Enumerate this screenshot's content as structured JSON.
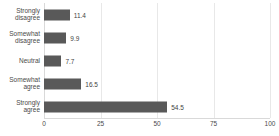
{
  "chart_data": {
    "type": "bar",
    "orientation": "horizontal",
    "title": "",
    "subtitle": "",
    "xlabel": "",
    "ylabel": "",
    "categories": [
      "Strongly disagree",
      "Somewhat disagree",
      "Neutral",
      "Somewhat agree",
      "Strongly agree"
    ],
    "values": [
      11.4,
      9.9,
      7.7,
      16.5,
      54.5
    ],
    "data_labels": [
      "11.4",
      "9.9",
      "7.7",
      "16.5",
      "54.5"
    ],
    "xlim": [
      0,
      100
    ],
    "xticks": [
      0,
      25,
      50,
      75,
      100
    ],
    "xtick_labels": [
      "0",
      "25",
      "50",
      "75",
      "100"
    ],
    "grid": "vertical",
    "legend": "none",
    "bar_color": "#595959",
    "gridline_color": "#e8e8e8",
    "axis_color": "#d9d9d9",
    "text_color": "#4a4a4a"
  }
}
